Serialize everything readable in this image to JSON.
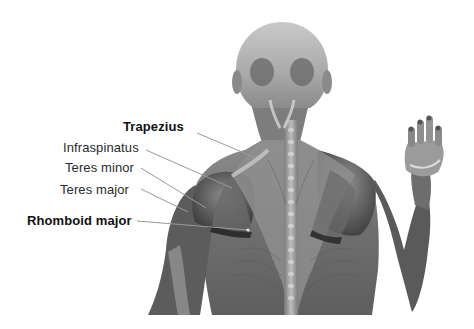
{
  "figure": {
    "background_color": "#ffffff"
  },
  "labels": [
    {
      "id": "trapezius",
      "text": "Trapezius",
      "bold": true,
      "x": 123,
      "y": 120,
      "line": [
        197,
        133,
        256,
        158
      ]
    },
    {
      "id": "infraspinatus",
      "text": "Infraspinatus",
      "bold": false,
      "x": 63,
      "y": 141,
      "line": [
        146,
        150,
        232,
        188
      ]
    },
    {
      "id": "teres-minor",
      "text": "Teres minor",
      "bold": false,
      "x": 65,
      "y": 161,
      "line": [
        141,
        168,
        206,
        208
      ]
    },
    {
      "id": "teres-major",
      "text": "Teres major",
      "bold": false,
      "x": 60,
      "y": 183,
      "line": [
        141,
        189,
        188,
        212
      ]
    },
    {
      "id": "rhomboid-major",
      "text": "Rhomboid major",
      "bold": true,
      "x": 27,
      "y": 214,
      "line": [
        137,
        221,
        248,
        230
      ]
    }
  ],
  "colors": {
    "label_text": "#2a2a2a",
    "leader_line": "#9a9a9a",
    "muscle_dark": "#4a4a4a",
    "muscle_mid": "#7a7a7a",
    "muscle_light": "#b5b5b5"
  }
}
